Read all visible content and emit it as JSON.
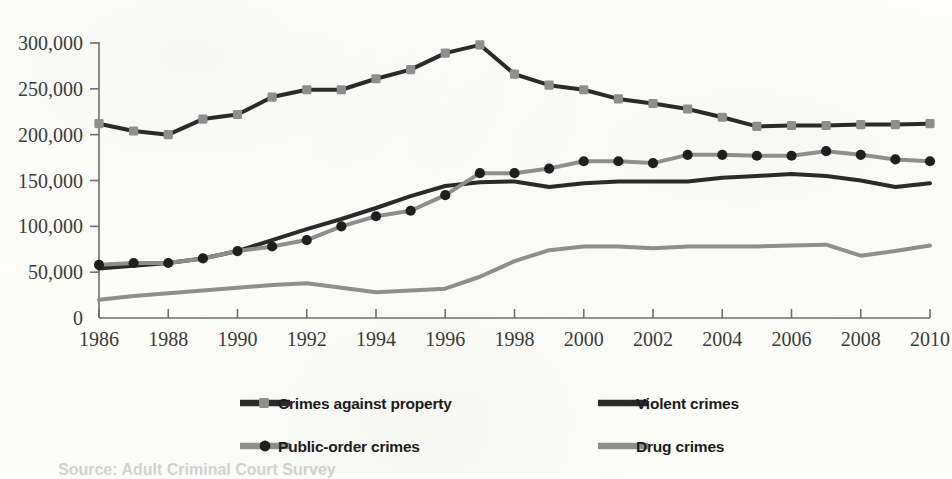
{
  "chart_data": {
    "type": "line",
    "title": "",
    "subtitle": "",
    "xlabel": "",
    "ylabel": "",
    "x": [
      1986,
      1987,
      1988,
      1989,
      1990,
      1991,
      1992,
      1993,
      1994,
      1995,
      1996,
      1997,
      1998,
      1999,
      2000,
      2001,
      2002,
      2003,
      2004,
      2005,
      2006,
      2007,
      2008,
      2009,
      2010
    ],
    "xlim": [
      1986,
      2010
    ],
    "ylim": [
      0,
      300000
    ],
    "xticks": [
      1986,
      1988,
      1990,
      1992,
      1994,
      1996,
      1998,
      2000,
      2002,
      2004,
      2006,
      2008,
      2010
    ],
    "xtick_labels": [
      "1986",
      "1988",
      "1990",
      "1992",
      "1994",
      "1996",
      "1998",
      "2000",
      "2002",
      "2004",
      "2006",
      "2008",
      "2010"
    ],
    "yticks": [
      0,
      50000,
      100000,
      150000,
      200000,
      250000,
      300000
    ],
    "ytick_labels": [
      "0",
      "50,000",
      "100,000",
      "150,000",
      "200,000",
      "250,000",
      "300,000"
    ],
    "grid": false,
    "legend_position": "bottom",
    "series": [
      {
        "name": "Crimes against property",
        "line_color": "#2a2a2a",
        "marker_color": "#8e8e8e",
        "marker": "square",
        "line_width": 4,
        "values": [
          212000,
          204000,
          200000,
          217000,
          222000,
          241000,
          249000,
          249000,
          261000,
          271000,
          289000,
          298000,
          266000,
          254000,
          249000,
          239000,
          234000,
          228000,
          219000,
          209000,
          210000,
          210000,
          211000,
          211000,
          212000
        ]
      },
      {
        "name": "Violent crimes",
        "line_color": "#2a2a2a",
        "marker_color": null,
        "marker": "none",
        "line_width": 4,
        "values": [
          54000,
          57000,
          60000,
          65000,
          73000,
          85000,
          97000,
          108000,
          120000,
          133000,
          144000,
          148000,
          149000,
          143000,
          147000,
          149000,
          149000,
          149000,
          153000,
          155000,
          157000,
          155000,
          150000,
          143000,
          147000
        ]
      },
      {
        "name": "Public-order crimes",
        "line_color": "#8e8e8e",
        "marker_color": "#1f1f1f",
        "marker": "circle",
        "line_width": 4,
        "values": [
          58000,
          60000,
          60000,
          65000,
          73000,
          78000,
          85000,
          100000,
          111000,
          117000,
          134000,
          158000,
          158000,
          163000,
          171000,
          171000,
          169000,
          178000,
          178000,
          177000,
          177000,
          182000,
          178000,
          173000,
          171000
        ]
      },
      {
        "name": "Drug crimes",
        "line_color": "#8e8e8e",
        "marker_color": null,
        "marker": "none",
        "line_width": 4,
        "values": [
          20000,
          24000,
          27000,
          30000,
          33000,
          36000,
          38000,
          33000,
          28000,
          30000,
          32000,
          45000,
          62000,
          74000,
          78000,
          78000,
          76000,
          78000,
          78000,
          78000,
          79000,
          80000,
          68000,
          73000,
          79000
        ]
      }
    ]
  },
  "legend": {
    "entries": [
      {
        "label": "Crimes against property",
        "series_index": 0
      },
      {
        "label": "Violent crimes",
        "series_index": 1
      },
      {
        "label": "Public-order crimes",
        "series_index": 2
      },
      {
        "label": "Drug crimes",
        "series_index": 3
      }
    ]
  },
  "bleed_text": "Source: Adult Criminal Court Survey"
}
